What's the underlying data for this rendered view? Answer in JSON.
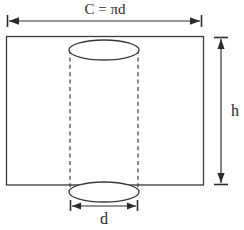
{
  "figure": {
    "background_color": "#ffffff",
    "stroke_color": "#3a3a3a",
    "label_color": "#2b2b2b"
  },
  "labels": {
    "circumference": "C = πd",
    "height": "h",
    "diameter": "d"
  },
  "shapes": {
    "rectangle": {
      "name": "lateral-surface-rectangle",
      "x": 6,
      "y": 36,
      "width": 198,
      "height": 149
    },
    "top_ellipse": {
      "name": "cylinder-top-circle",
      "cx": 104,
      "cy": 50,
      "rx": 35,
      "ry": 10
    },
    "bottom_ellipse": {
      "name": "cylinder-bottom-circle",
      "cx": 104,
      "cy": 192,
      "rx": 35,
      "ry": 10
    },
    "dashed_left": {
      "name": "cylinder-left-edge",
      "x": 70,
      "y1": 50,
      "y2": 192
    },
    "dashed_right": {
      "name": "cylinder-right-edge",
      "x": 138,
      "y1": 50,
      "y2": 192
    }
  },
  "dimensions": {
    "circumference_line": {
      "name": "circumference-dimension",
      "y": 21,
      "x1": 8,
      "x2": 201,
      "label_x": 105,
      "label_y": 14
    },
    "height_line": {
      "name": "height-dimension",
      "x": 221,
      "y1": 38,
      "y2": 184,
      "label_x": 231,
      "label_y": 116
    },
    "diameter_line": {
      "name": "diameter-dimension",
      "y": 206,
      "x1": 71,
      "x2": 137,
      "label_x": 104,
      "label_y": 224
    }
  }
}
